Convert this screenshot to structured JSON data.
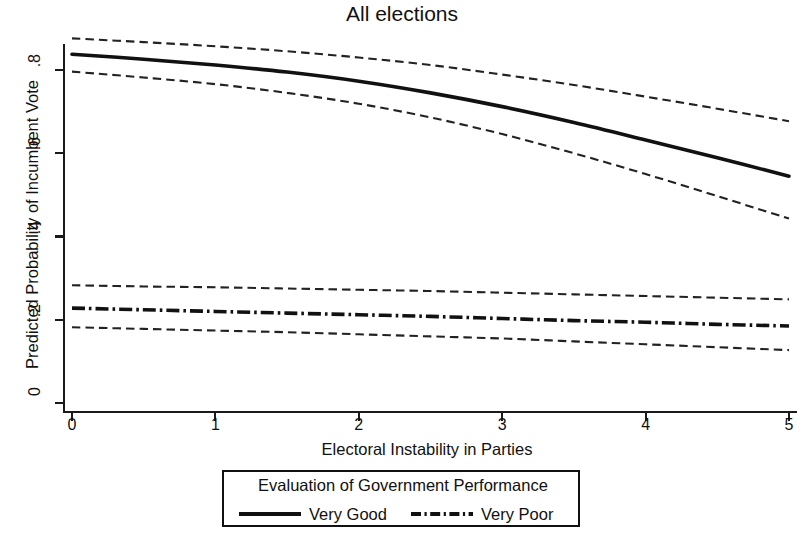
{
  "chart_data": {
    "type": "line",
    "title": "All elections",
    "xlabel": "Electoral Instability in Parties",
    "ylabel": "Predicted Probability of Incumbent Vote",
    "xlim": [
      0,
      5
    ],
    "ylim": [
      0,
      0.88
    ],
    "grid": false,
    "xticks": [
      0,
      1,
      2,
      3,
      4,
      5
    ],
    "xtick_labels": [
      "0",
      "1",
      "2",
      "3",
      "4",
      "5"
    ],
    "yticks": [
      0,
      0.2,
      0.4,
      0.6,
      0.8
    ],
    "ytick_labels": [
      "0",
      ".2",
      ".4",
      ".6",
      ".8"
    ],
    "legend": {
      "title": "Evaluation of Government Performance",
      "position": "below-axes",
      "entries": [
        {
          "label": "Very Good",
          "style": "solid"
        },
        {
          "label": "Very Poor",
          "style": "dash-dot"
        }
      ]
    },
    "x": [
      0,
      0.5,
      1,
      1.5,
      2,
      2.5,
      3,
      3.5,
      4,
      4.5,
      5
    ],
    "series": [
      {
        "name": "Very Good",
        "style": "solid",
        "values": [
          0.838,
          0.826,
          0.812,
          0.795,
          0.773,
          0.745,
          0.712,
          0.674,
          0.632,
          0.589,
          0.545
        ],
        "ci_upper": {
          "style": "dashed",
          "values": [
            0.876,
            0.867,
            0.857,
            0.845,
            0.83,
            0.812,
            0.789,
            0.764,
            0.736,
            0.707,
            0.677
          ]
        },
        "ci_lower": {
          "style": "dashed",
          "values": [
            0.796,
            0.782,
            0.766,
            0.745,
            0.719,
            0.686,
            0.646,
            0.6,
            0.55,
            0.497,
            0.443
          ]
        }
      },
      {
        "name": "Very Poor",
        "style": "dash-dot",
        "values": [
          0.228,
          0.224,
          0.22,
          0.216,
          0.212,
          0.208,
          0.203,
          0.198,
          0.194,
          0.189,
          0.185
        ],
        "ci_upper": {
          "style": "dashed",
          "values": [
            0.283,
            0.28,
            0.278,
            0.275,
            0.272,
            0.269,
            0.265,
            0.261,
            0.257,
            0.253,
            0.249
          ]
        },
        "ci_lower": {
          "style": "dashed",
          "values": [
            0.182,
            0.178,
            0.174,
            0.17,
            0.165,
            0.16,
            0.155,
            0.148,
            0.141,
            0.134,
            0.127
          ]
        }
      }
    ]
  }
}
